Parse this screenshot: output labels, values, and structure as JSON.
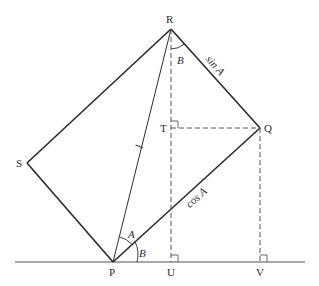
{
  "diagram": {
    "colors": {
      "line": "#2a2a2a",
      "baseline": "#8a8a8a",
      "dashed": "#555555"
    },
    "points": {
      "R": {
        "label": "R",
        "x": 171,
        "y": 29
      },
      "P": {
        "label": "P",
        "x": 113,
        "y": 262
      },
      "Q": {
        "label": "Q",
        "x": 260,
        "y": 128
      },
      "S": {
        "label": "S",
        "x": 27,
        "y": 163
      },
      "T": {
        "label": "T",
        "x": 171,
        "y": 128
      },
      "U": {
        "label": "U",
        "x": 171,
        "y": 262
      },
      "V": {
        "label": "V",
        "x": 260,
        "y": 262
      }
    },
    "edge_labels": {
      "hypotenuse": "l",
      "RQ": "sin A",
      "PQ": "cos A"
    },
    "angle_labels": {
      "at_P_A": "A",
      "at_P_B": "B",
      "at_R_B": "B"
    }
  }
}
